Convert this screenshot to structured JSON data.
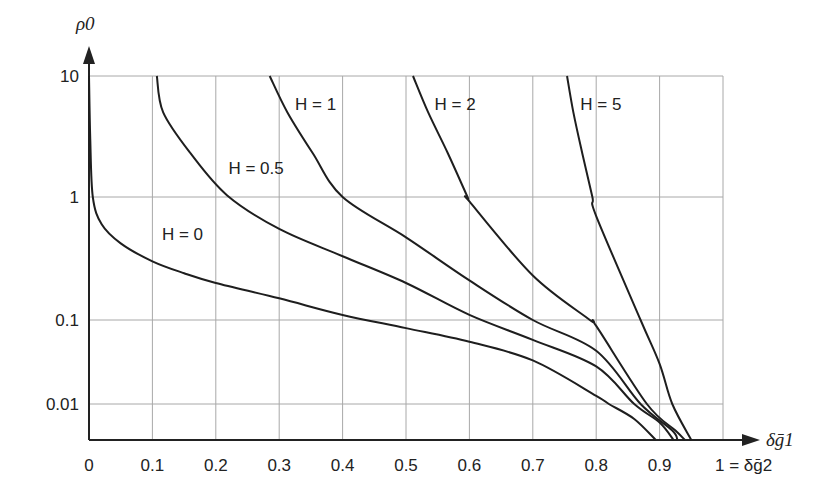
{
  "chart_data": {
    "type": "line",
    "title": "",
    "xlabel": "δḡ1",
    "xlabel_end": "1 = δḡ2",
    "ylabel": "ρ0",
    "x_ticks": [
      "0",
      "0.1",
      "0.2",
      "0.3",
      "0.4",
      "0.5",
      "0.6",
      "0.7",
      "0.8",
      "0.9"
    ],
    "x_tick_values": [
      0,
      0.1,
      0.2,
      0.3,
      0.4,
      0.5,
      0.6,
      0.7,
      0.8,
      0.9
    ],
    "y_ticks": [
      "10",
      "1",
      "0.1",
      "0.01"
    ],
    "y_tick_values": [
      10,
      1,
      0.1,
      0.01
    ],
    "xlim": [
      0,
      1
    ],
    "ylim": [
      0.005,
      10
    ],
    "yscale": "log",
    "grid": true,
    "legend": "none (inline curve labels)",
    "series": [
      {
        "name": "H = 0",
        "label_pos": [
          0.115,
          0.45
        ],
        "points": [
          [
            0.0,
            10
          ],
          [
            0.002,
            3
          ],
          [
            0.006,
            1
          ],
          [
            0.02,
            0.6
          ],
          [
            0.05,
            0.42
          ],
          [
            0.1,
            0.3
          ],
          [
            0.15,
            0.24
          ],
          [
            0.2,
            0.2
          ],
          [
            0.3,
            0.15
          ],
          [
            0.4,
            0.11
          ],
          [
            0.5,
            0.08
          ],
          [
            0.6,
            0.055
          ],
          [
            0.7,
            0.033
          ],
          [
            0.8,
            0.0125
          ],
          [
            0.82,
            0.01
          ],
          [
            0.86,
            0.0075
          ],
          [
            0.894,
            0.005
          ]
        ]
      },
      {
        "name": "H = 0.5",
        "label_pos": [
          0.22,
          1.55
        ],
        "points": [
          [
            0.107,
            10
          ],
          [
            0.117,
            5
          ],
          [
            0.16,
            2.3
          ],
          [
            0.218,
            1.03
          ],
          [
            0.3,
            0.55
          ],
          [
            0.4,
            0.33
          ],
          [
            0.5,
            0.2
          ],
          [
            0.6,
            0.11
          ],
          [
            0.7,
            0.058
          ],
          [
            0.8,
            0.028
          ],
          [
            0.86,
            0.01
          ],
          [
            0.9,
            0.007
          ],
          [
            0.922,
            0.005
          ]
        ]
      },
      {
        "name": "H = 1",
        "label_pos": [
          0.325,
          5.2
        ],
        "points": [
          [
            0.285,
            10
          ],
          [
            0.313,
            5
          ],
          [
            0.353,
            2.3
          ],
          [
            0.4,
            1.0
          ],
          [
            0.5,
            0.47
          ],
          [
            0.6,
            0.21
          ],
          [
            0.7,
            0.1
          ],
          [
            0.8,
            0.043
          ],
          [
            0.87,
            0.01
          ],
          [
            0.92,
            0.006
          ],
          [
            0.928,
            0.005
          ]
        ]
      },
      {
        "name": "H = 2",
        "label_pos": [
          0.545,
          5.2
        ],
        "points": [
          [
            0.511,
            10
          ],
          [
            0.535,
            5
          ],
          [
            0.566,
            2.3
          ],
          [
            0.597,
            1.0
          ],
          [
            0.6,
            0.92
          ],
          [
            0.7,
            0.23
          ],
          [
            0.79,
            0.1
          ],
          [
            0.8,
            0.085
          ],
          [
            0.88,
            0.01
          ],
          [
            0.925,
            0.006
          ],
          [
            0.94,
            0.005
          ]
        ]
      },
      {
        "name": "H = 5",
        "label_pos": [
          0.775,
          5.2
        ],
        "points": [
          [
            0.754,
            10
          ],
          [
            0.764,
            5
          ],
          [
            0.778,
            2.3
          ],
          [
            0.794,
            1.0
          ],
          [
            0.8,
            0.7
          ],
          [
            0.87,
            0.1
          ],
          [
            0.9,
            0.03
          ],
          [
            0.92,
            0.01
          ],
          [
            0.95,
            0.005
          ]
        ]
      }
    ]
  }
}
